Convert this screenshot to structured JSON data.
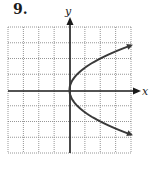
{
  "problem": {
    "number": "9."
  },
  "axes": {
    "x_label": "x",
    "y_label": "y"
  },
  "colors": {
    "grid": "#8a8a8a",
    "axis": "#1a1a1a",
    "curve": "#3a3a3a",
    "background": "#ffffff"
  },
  "chart_data": {
    "type": "line",
    "title": "9.",
    "xlabel": "x",
    "ylabel": "y",
    "xlim": [
      -4,
      4
    ],
    "ylim": [
      -4,
      4
    ],
    "grid": true,
    "grid_step": 1,
    "tick_labels": false,
    "legend": null,
    "series": [
      {
        "name": "parabola opening right (y^2 = 2x)",
        "equation": "x = y^2 / 2",
        "vertex": [
          0,
          0
        ],
        "arrows_at_ends": true,
        "points": [
          [
            4,
            2.83
          ],
          [
            3,
            2.45
          ],
          [
            2,
            2.0
          ],
          [
            1,
            1.41
          ],
          [
            0.5,
            1.0
          ],
          [
            0.125,
            0.5
          ],
          [
            0,
            0
          ],
          [
            0.125,
            -0.5
          ],
          [
            0.5,
            -1.0
          ],
          [
            1,
            -1.41
          ],
          [
            2,
            -2.0
          ],
          [
            3,
            -2.45
          ],
          [
            4,
            -2.83
          ]
        ]
      }
    ]
  }
}
